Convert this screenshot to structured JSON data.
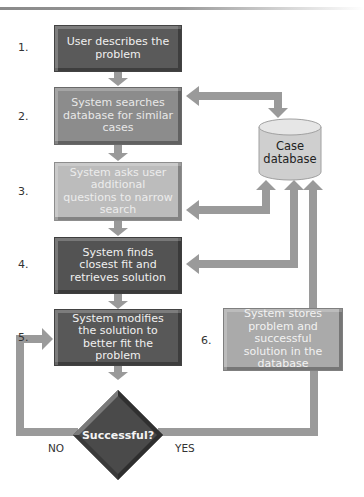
{
  "steps": [
    {
      "number": "1.",
      "text": "User describes the problem"
    },
    {
      "number": "2.",
      "text": "System searches database for similar cases"
    },
    {
      "number": "3.",
      "text": "System asks user additional questions to narrow search"
    },
    {
      "number": "4.",
      "text": "System finds closest fit and retrieves solution"
    },
    {
      "number": "5.",
      "text": "System modifies the solution to better fit the problem"
    },
    {
      "number": "6.",
      "text": "System stores problem and successful solution in the database"
    }
  ],
  "database": {
    "label": "Case database"
  },
  "decision": {
    "label": "Successful?",
    "no_label": "NO",
    "yes_label": "YES"
  },
  "colors": {
    "step1": "#5a5a5a",
    "step2": "#8c8c8c",
    "step3": "#bcbcbc",
    "step4": "#535353",
    "step5": "#585858",
    "step6": "#aaaaaa",
    "arrow": "#9a9a9a",
    "database": "#d0d0d0",
    "decision": "#4a4a4a"
  }
}
